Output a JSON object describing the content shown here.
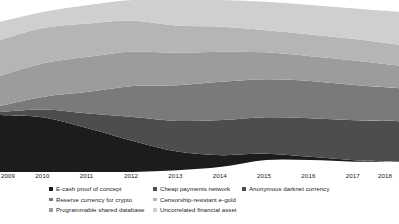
{
  "chart_data": {
    "type": "area",
    "title": "",
    "subtitle": "",
    "xlabel": "",
    "ylabel": "",
    "stacked": true,
    "grid": false,
    "legend_position": "bottom",
    "axis": {
      "x_ticks": [
        "2009",
        "2010",
        "2011",
        "2012",
        "2013",
        "2014",
        "2015",
        "2016",
        "2017",
        "2018"
      ],
      "x_range": [
        2009,
        2018
      ],
      "y_axis_visible": false,
      "y_ticks": []
    },
    "x": [
      2009,
      2010,
      2011,
      2012,
      2013,
      2014,
      2015,
      2016,
      2017,
      2018
    ],
    "series": [
      {
        "name": "E-cash proof of concept",
        "color": "#1c1c1c",
        "values": [
          38,
          34,
          26,
          18,
          11,
          7,
          4,
          2,
          1,
          0
        ]
      },
      {
        "name": "Reserve currency for crypto",
        "color": "#4d4d4d",
        "values": [
          2,
          5,
          9,
          14,
          18,
          21,
          23,
          25,
          26,
          27
        ]
      },
      {
        "name": "Programmable shared database",
        "color": "#7a7a7a",
        "values": [
          4,
          8,
          13,
          18,
          21,
          23,
          24,
          24,
          23,
          22
        ]
      },
      {
        "name": "Cheap payments network",
        "color": "#9c9c9c",
        "values": [
          20,
          21,
          21,
          20,
          19,
          18,
          17,
          16,
          16,
          15
        ]
      },
      {
        "name": "Censorship-resistant e-gold",
        "color": "#b5b5b5",
        "values": [
          24,
          22,
          20,
          18,
          16,
          15,
          14,
          14,
          14,
          14
        ]
      },
      {
        "name": "Uncorrelated financial asset",
        "color": "#cfcfcf",
        "values": [
          12,
          10,
          11,
          12,
          15,
          16,
          18,
          19,
          20,
          22
        ]
      }
    ]
  },
  "legend": {
    "columns": [
      {
        "items": [
          {
            "label": "E-cash proof of concept",
            "color": "#1c1c1c"
          },
          {
            "label": "Reserve currency for crypto",
            "color": "#7a7a7a"
          },
          {
            "label": "Programmable shared database",
            "color": "#9c9c9c"
          }
        ]
      },
      {
        "items": [
          {
            "label": "Cheap payments network",
            "color": "#4d4d4d"
          },
          {
            "label": "Censorship-resistant e-gold",
            "color": "#b5b5b5"
          },
          {
            "label": "Uncorrelated financial asset",
            "color": "#cfcfcf"
          }
        ]
      },
      {
        "items": [
          {
            "label": "Anonymous darknet currency",
            "color": "#4d4d4d"
          }
        ]
      }
    ]
  },
  "colors": {
    "background": "#ffffff",
    "text": "#1a1a1a"
  }
}
